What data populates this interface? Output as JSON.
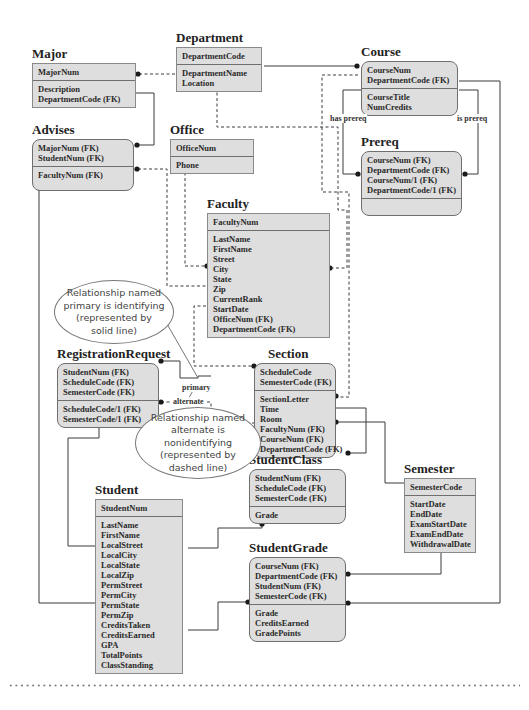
{
  "diagram": {
    "type": "IDEF1X entity-relationship diagram",
    "entities": {
      "major": {
        "title": "Major",
        "key": [
          "MajorNum"
        ],
        "attrs": [
          "Description",
          "DepartmentCode (FK)"
        ]
      },
      "department": {
        "title": "Department",
        "key": [
          "DepartmentCode"
        ],
        "attrs": [
          "DepartmentName",
          "Location"
        ]
      },
      "course": {
        "title": "Course",
        "key": [
          "CourseNum",
          "DepartmentCode (FK)"
        ],
        "attrs": [
          "CourseTitle",
          "NumCredits"
        ]
      },
      "advises": {
        "title": "Advises",
        "key": [
          "MajorNum (FK)",
          "StudentNum (FK)"
        ],
        "attrs": [
          "FacultyNum (FK)"
        ]
      },
      "office": {
        "title": "Office",
        "key": [
          "OfficeNum"
        ],
        "attrs": [
          "Phone"
        ]
      },
      "prereq": {
        "title": "Prereq",
        "key": [
          "CourseNum (FK)",
          "DepartmentCode (FK)",
          "CourseNum/1 (FK)",
          "DepartmentCode/1 (FK)"
        ],
        "attrs": []
      },
      "faculty": {
        "title": "Faculty",
        "key": [
          "FacultyNum"
        ],
        "attrs": [
          "LastName",
          "FirstName",
          "Street",
          "City",
          "State",
          "Zip",
          "CurrentRank",
          "StartDate",
          "OfficeNum (FK)",
          "DepartmentCode (FK)"
        ]
      },
      "registration_request": {
        "title": "RegistrationRequest",
        "key": [
          "StudentNum (FK)",
          "ScheduleCode (FK)",
          "SemesterCode (FK)"
        ],
        "attrs": [
          "ScheduleCode/1 (FK)",
          "SemesterCode/1 (FK)"
        ]
      },
      "section": {
        "title": "Section",
        "key": [
          "ScheduleCode",
          "SemesterCode (FK)"
        ],
        "attrs": [
          "SectionLetter",
          "Time",
          "Room",
          "FacultyNum (FK)",
          "CourseNum (FK)",
          "DepartmentCode (FK)"
        ]
      },
      "student_class": {
        "title": "StudentClass",
        "key": [
          "StudentNum (FK)",
          "ScheduleCode (FK)",
          "SemesterCode (FK)"
        ],
        "attrs": [
          "Grade"
        ]
      },
      "semester": {
        "title": "Semester",
        "key": [
          "SemesterCode"
        ],
        "attrs": [
          "StartDate",
          "EndDate",
          "ExamStartDate",
          "ExamEndDate",
          "WithdrawalDate"
        ]
      },
      "student": {
        "title": "Student",
        "key": [
          "StudentNum"
        ],
        "attrs": [
          "LastName",
          "FirstName",
          "LocalStreet",
          "LocalCity",
          "LocalState",
          "LocalZip",
          "PermStreet",
          "PermCity",
          "PermState",
          "PermZip",
          "CreditsTaken",
          "CreditsEarned",
          "GPA",
          "TotalPoints",
          "ClassStanding"
        ]
      },
      "student_grade": {
        "title": "StudentGrade",
        "key": [
          "CourseNum (FK)",
          "DepartmentCode (FK)",
          "StudentNum (FK)",
          "SemesterCode (FK)"
        ],
        "attrs": [
          "Grade",
          "CreditsEarned",
          "GradePoints"
        ]
      }
    },
    "relationship_labels": {
      "has_prereq": "has prereq",
      "is_prereq": "is prereq",
      "primary": "primary",
      "alternate": "alternate"
    },
    "annotations": {
      "identifying": [
        "Relationship named",
        "primary is identifying",
        "(represented by",
        "solid line)"
      ],
      "nonidentifying": [
        "Relationship named",
        "alternate is nonidentifying",
        "(represented by",
        "dashed line)"
      ]
    },
    "colors": {
      "entity_fill": "#dedede",
      "entity_border": "#6f6f6f",
      "line": "#333333"
    }
  }
}
